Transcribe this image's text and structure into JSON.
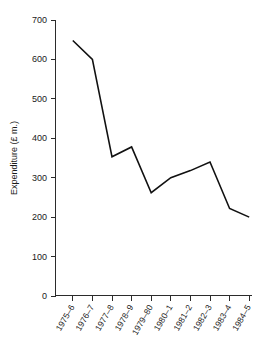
{
  "chart_data": {
    "type": "line",
    "title": "",
    "subtitle": "",
    "xlabel": "",
    "ylabel": "Expenditure (£ m.)",
    "categories": [
      "1975–6",
      "1976–7",
      "1977–8",
      "1978–9",
      "1979–80",
      "1980–1",
      "1981–2",
      "1982–3",
      "1983–4",
      "1984–5"
    ],
    "values": [
      648,
      600,
      353,
      378,
      262,
      300,
      318,
      340,
      222,
      200
    ],
    "series": [
      {
        "name": "Expenditure",
        "values": [
          648,
          600,
          353,
          378,
          262,
          300,
          318,
          340,
          222,
          200
        ]
      }
    ],
    "ylim": [
      0,
      700
    ],
    "yticks": [
      0,
      100,
      200,
      300,
      400,
      500,
      600,
      700
    ],
    "ytick_labels": [
      "0",
      "100",
      "200",
      "300",
      "400",
      "500",
      "600",
      "700"
    ],
    "grid": false,
    "legend": false,
    "legend_position": "none",
    "line_color": "#111111",
    "axis_color": "#2b2b2b",
    "background_color": "#ffffff",
    "xtick_rotation_degrees": -60,
    "annotations": []
  }
}
